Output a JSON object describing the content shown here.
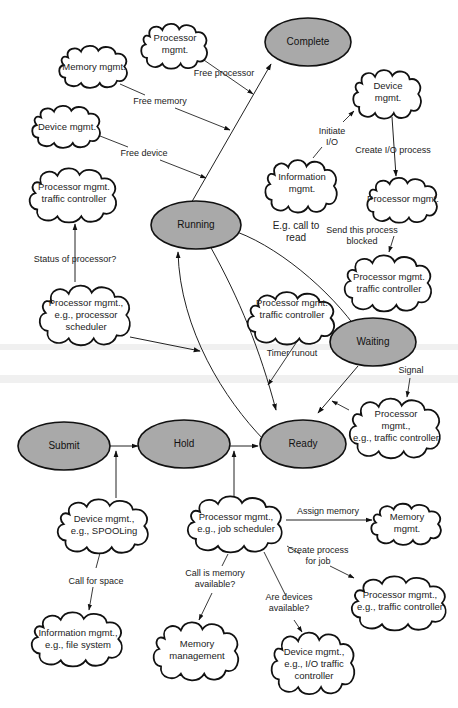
{
  "diagram": {
    "states": {
      "complete": "Complete",
      "running": "Running",
      "waiting": "Waiting",
      "submit": "Submit",
      "hold": "Hold",
      "ready": "Ready"
    },
    "clouds": {
      "processor_mgmt_top": [
        "Processor",
        "mgmt."
      ],
      "memory_mgmt_top": [
        "Memory mgmt."
      ],
      "device_mgmt_left": [
        "Device mgmt."
      ],
      "proc_traffic_left": [
        "Processor mgmt.",
        "traffic controller"
      ],
      "proc_scheduler": [
        "Processor mgmt.,",
        "e.g., processor",
        "scheduler"
      ],
      "device_mgmt_right": [
        "Device",
        "mgmt."
      ],
      "info_mgmt": [
        "Information",
        "mgmt."
      ],
      "proc_mgmt_right": [
        "Processor mgmt."
      ],
      "proc_traffic_right": [
        "Processor mgmt.",
        "traffic controller"
      ],
      "proc_traffic_mid": [
        "Processor mgmt.",
        "traffic controller"
      ],
      "proc_signal": [
        "Processor",
        "mgmt.,",
        "e.g., traffic controller"
      ],
      "device_spooling": [
        "Device mgmt.,",
        "e.g., SPOOLing"
      ],
      "job_scheduler": [
        "Processor mgmt.,",
        "e.g., job scheduler"
      ],
      "memory_mgmt_bottom": [
        "Memory",
        "mgmt."
      ],
      "proc_traffic_bottom": [
        "Processor mgmt.,",
        "e.g., traffic controller"
      ],
      "info_filesystem": [
        "Information mgmt.,",
        "e.g., file system"
      ],
      "memory_management": [
        "Memory",
        "management"
      ],
      "device_io": [
        "Device mgmt.,",
        "e.g., I/O traffic",
        "controller"
      ]
    },
    "labels": {
      "free_processor": "Free processor",
      "free_memory": "Free memory",
      "free_device": "Free device",
      "initiate_io": [
        "Initiate",
        "I/O"
      ],
      "create_io_process": "Create I/O process",
      "status_of_processor": "Status of processor?",
      "call_to_read": [
        "E.g. call to",
        "read"
      ],
      "send_blocked": [
        "Send this process",
        "blocked"
      ],
      "timer_runout": "Timer runout",
      "signal": "Signal",
      "assign_memory": "Assign memory",
      "create_process": [
        "Create process",
        "for job"
      ],
      "call_memory": [
        "Call is memory",
        "available?"
      ],
      "are_devices": [
        "Are devices",
        "available?"
      ],
      "call_for_space": "Call for space"
    },
    "colors": {
      "state_fill": "#a9a9a9",
      "outline": "#111111",
      "background": "#ffffff"
    }
  }
}
